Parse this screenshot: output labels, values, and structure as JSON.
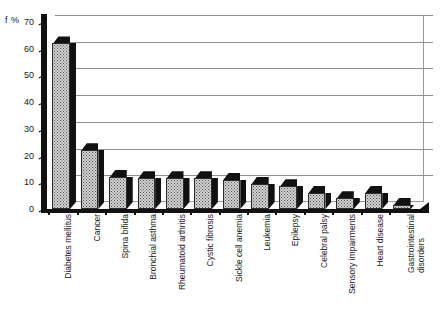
{
  "chart_data": {
    "type": "bar",
    "title": "",
    "subtitle": "",
    "xlabel": "",
    "ylabel": "f %",
    "ylim": [
      0,
      70
    ],
    "yticks": [
      0,
      10,
      20,
      30,
      40,
      50,
      60,
      70
    ],
    "grid": true,
    "legend": null,
    "legend_position": "none",
    "style": "3d-bar",
    "categories": [
      "Diabetes mellitus",
      "Cancer",
      "Spina bifida",
      "Bronchial asthma",
      "Rheumatoid arthritis",
      "Cystic fibrosis",
      "Sickle cell anemia",
      "Leukemia",
      "Epilepsy",
      "Celebral palsy",
      "Sensory impairments",
      "Heart disease",
      "Gastrointestinal disorders"
    ],
    "category_lines": [
      [
        "Diabetes mellitus"
      ],
      [
        "Cancer"
      ],
      [
        "Spina bifida"
      ],
      [
        "Bronchial asthma"
      ],
      [
        "Rheumatoid arthritis"
      ],
      [
        "Cystic fibrosis"
      ],
      [
        "Sickle cell anemia"
      ],
      [
        "Leukemia"
      ],
      [
        "Epilepsy"
      ],
      [
        "Celebral palsy"
      ],
      [
        "Sensory impairments"
      ],
      [
        "Heart disease"
      ],
      [
        "Gastrointestinal",
        "disorders"
      ]
    ],
    "values": [
      62,
      22,
      12,
      11.5,
      11.5,
      11.5,
      11,
      9.5,
      8.5,
      6,
      4,
      6,
      1.5
    ],
    "colors": {
      "bar_fill": "#d6d6d6",
      "bar_pattern": "#4a4a4a",
      "bar_edge": "#2b2b2b",
      "bar_shadow": "#111111",
      "gridline": "#8f8f8f",
      "axis": "#111111",
      "background": "#ffffff",
      "text": "#1a1a1a"
    }
  }
}
